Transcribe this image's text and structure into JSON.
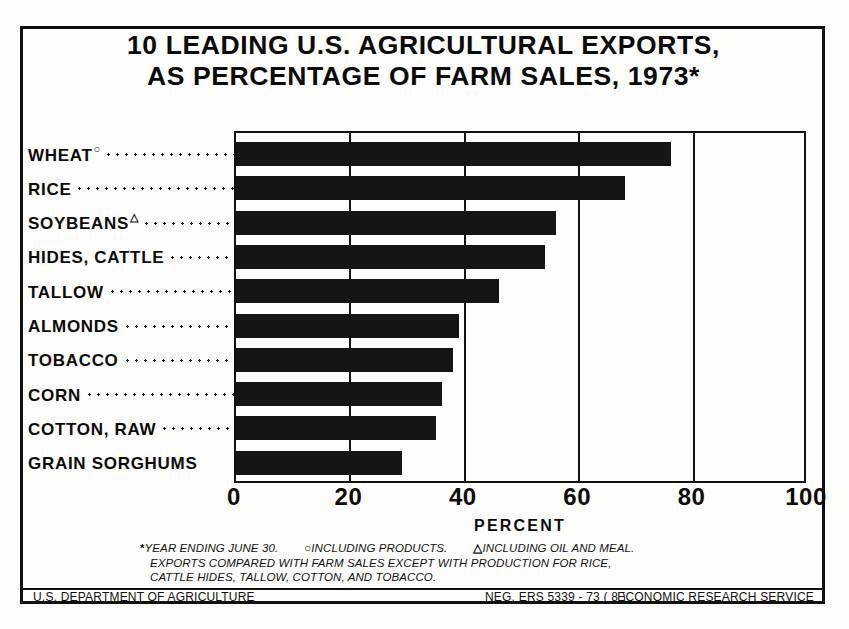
{
  "title": {
    "line1": "10 LEADING U.S. AGRICULTURAL EXPORTS,",
    "line2": "AS PERCENTAGE OF FARM SALES, 1973*"
  },
  "axis": {
    "title": "PERCENT",
    "ticks": [
      "0",
      "20",
      "40",
      "60",
      "80",
      "100"
    ]
  },
  "footnotes": {
    "mark_asterisk": "*",
    "note_asterisk": "YEAR ENDING JUNE 30.",
    "mark_circle": "○",
    "note_circle": "INCLUDING PRODUCTS.",
    "mark_triangle": "△",
    "note_triangle": "INCLUDING OIL AND MEAL.",
    "line2": "EXPORTS COMPARED WITH FARM SALES EXCEPT WITH PRODUCTION FOR RICE,",
    "line3": "CATTLE HIDES, TALLOW, COTTON, AND TOBACCO."
  },
  "footer": {
    "left": "U.S. DEPARTMENT OF AGRICULTURE",
    "middle": "NEG. ERS 5339 - 73 ( 8 )",
    "right": "ECONOMIC RESEARCH SERVICE"
  },
  "colors": {
    "bar": "#151515",
    "ink": "#0b0b0b",
    "paper": "#fdfdfb"
  },
  "chart_data": {
    "type": "bar",
    "orientation": "horizontal",
    "title": "10 LEADING U.S. AGRICULTURAL EXPORTS, AS PERCENTAGE OF FARM SALES, 1973*",
    "xlabel": "PERCENT",
    "ylabel": "",
    "xlim": [
      0,
      100
    ],
    "xticks": [
      0,
      20,
      40,
      60,
      80,
      100
    ],
    "grid": true,
    "grid_axis": "x",
    "legend": false,
    "categories": [
      "WHEAT",
      "RICE",
      "SOYBEANS",
      "HIDES, CATTLE",
      "TALLOW",
      "ALMONDS",
      "TOBACCO",
      "CORN",
      "COTTON, RAW",
      "GRAIN SORGHUMS"
    ],
    "category_marks": [
      "○",
      "",
      "△",
      "",
      "",
      "",
      "",
      "",
      "",
      ""
    ],
    "values": [
      76,
      68,
      56,
      54,
      46,
      39,
      38,
      36,
      35,
      29
    ],
    "annotations": [
      "* YEAR ENDING JUNE 30.",
      "○ INCLUDING PRODUCTS.",
      "△ INCLUDING OIL AND MEAL.",
      "EXPORTS COMPARED WITH FARM SALES EXCEPT WITH PRODUCTION FOR RICE, CATTLE HIDES, TALLOW, COTTON, AND TOBACCO."
    ]
  }
}
